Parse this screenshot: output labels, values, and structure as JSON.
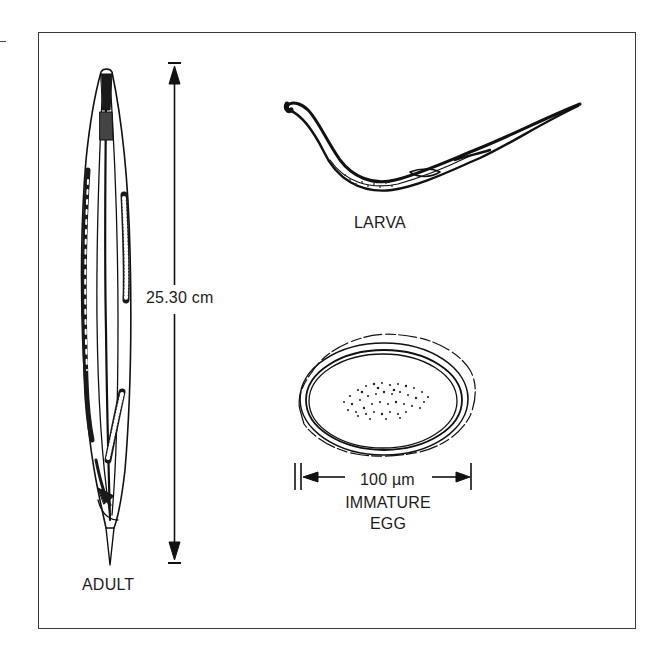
{
  "figure": {
    "stages": [
      {
        "id": "adult",
        "label": "ADULT"
      },
      {
        "id": "larva",
        "label": "LARVA"
      },
      {
        "id": "egg",
        "label_line1": "IMMATURE",
        "label_line2": "EGG"
      }
    ],
    "measurements": {
      "adult_length": "25.30 cm",
      "egg_width": "100 µm"
    },
    "colors": {
      "ink": "#1a1a1a",
      "frame": "#3a3a3a",
      "background": "#ffffff"
    }
  }
}
